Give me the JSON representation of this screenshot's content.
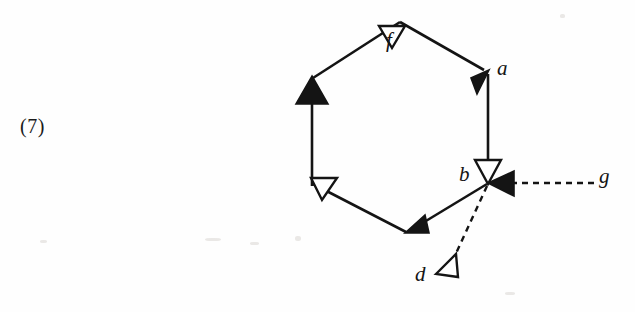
{
  "page": {
    "background_color": "#fefefe",
    "ink_color": "#141414",
    "width": 635,
    "height": 312
  },
  "equation_number": {
    "text": "(7)"
  },
  "figure": {
    "type": "directed-graph-diagram",
    "nodes": [
      {
        "id": "f",
        "label": "f",
        "x": 400,
        "y": 22,
        "label_x": 386,
        "label_y": 30
      },
      {
        "id": "a",
        "label": "a",
        "x": 488,
        "y": 72,
        "label_x": 497,
        "label_y": 58
      },
      {
        "id": "b",
        "label": "b",
        "x": 488,
        "y": 183,
        "label_x": 459,
        "label_y": 164
      },
      {
        "id": "g",
        "label": "g",
        "x": 600,
        "y": 183,
        "label_x": 599,
        "label_y": 166
      },
      {
        "id": "d",
        "label": "d",
        "x": 436,
        "y": 272,
        "label_x": 415,
        "label_y": 264
      },
      {
        "id": "v_upper_left",
        "label": "",
        "x": 312,
        "y": 78,
        "label_x": 0,
        "label_y": 0
      },
      {
        "id": "v_lower_left",
        "label": "",
        "x": 312,
        "y": 183,
        "label_x": 0,
        "label_y": 0
      },
      {
        "id": "v_bottom",
        "label": "",
        "x": 408,
        "y": 232,
        "label_x": 0,
        "label_y": 0
      }
    ],
    "edges": [
      {
        "from": "v_upper_left",
        "to": "f",
        "style": "solid",
        "arrowhead": "hollow-triangle",
        "arrow_at": "mid"
      },
      {
        "from": "f",
        "to": "a",
        "style": "solid",
        "arrowhead": "solid-triangle",
        "arrow_at": "end"
      },
      {
        "from": "a",
        "to": "b",
        "style": "solid",
        "arrowhead": "hollow-triangle",
        "arrow_at": "end"
      },
      {
        "from": "b",
        "to": "v_bottom",
        "style": "solid",
        "arrowhead": "solid-triangle",
        "arrow_at": "end"
      },
      {
        "from": "v_bottom",
        "to": "v_lower_left",
        "style": "solid",
        "arrowhead": "hollow-triangle",
        "arrow_at": "end"
      },
      {
        "from": "v_lower_left",
        "to": "v_upper_left",
        "style": "solid",
        "arrowhead": "solid-triangle",
        "arrow_at": "end"
      },
      {
        "from": "g",
        "to": "b",
        "style": "dashed",
        "arrowhead": "solid-triangle",
        "arrow_at": "end"
      },
      {
        "from": "b",
        "to": "d",
        "style": "dashed",
        "arrowhead": "hollow-triangle",
        "arrow_at": "end"
      }
    ],
    "labels": {
      "f": "f",
      "a": "a",
      "b": "b",
      "g": "g",
      "d": "d"
    }
  }
}
